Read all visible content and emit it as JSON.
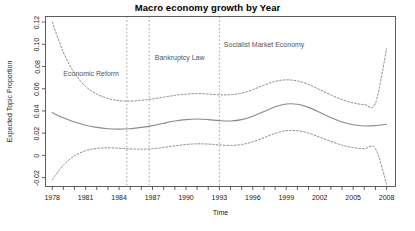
{
  "chart_data": {
    "type": "line",
    "title": "Macro economy growth by Year",
    "xlabel": "Time",
    "ylabel": "Expected Topic Proportion",
    "xlim": [
      1977.4,
      2008.8
    ],
    "ylim": [
      -0.028,
      0.125
    ],
    "grid": false,
    "legend": null,
    "x_ticks": [
      1978,
      1981,
      1984,
      1987,
      1990,
      1993,
      1996,
      1999,
      2002,
      2005,
      2008
    ],
    "x_tick_labels": [
      "1978",
      "1981",
      "1984",
      "1987",
      "1990",
      "1993",
      "1996",
      "1999",
      "2002",
      "2005",
      "2008"
    ],
    "x_minor_ticks": [
      1979,
      1980,
      1982,
      1983,
      1985,
      1986,
      1988,
      1989,
      1991,
      1992,
      1994,
      1995,
      1997,
      1998,
      2000,
      2001,
      2003,
      2004,
      2006,
      2007
    ],
    "y_ticks": [
      -0.02,
      0,
      0.02,
      0.04,
      0.06,
      0.08,
      0.1,
      0.12
    ],
    "y_tick_labels": [
      "-0.02",
      "0",
      "0.02",
      "0.04",
      "0.06",
      "0.08",
      "0.10",
      "0.12"
    ],
    "series": [
      {
        "name": "Expected topic proportion",
        "style": "solid",
        "color": "#8a8a8a",
        "x": [
          1978,
          1979,
          1980,
          1981,
          1982,
          1983,
          1984,
          1985,
          1986,
          1987,
          1988,
          1989,
          1990,
          1991,
          1992,
          1993,
          1994,
          1995,
          1996,
          1997,
          1998,
          1999,
          2000,
          2001,
          2002,
          2003,
          2004,
          2005,
          2006,
          2007,
          2008
        ],
        "values": [
          0.0385,
          0.0338,
          0.03,
          0.0272,
          0.0252,
          0.024,
          0.0236,
          0.024,
          0.0252,
          0.0268,
          0.0289,
          0.0309,
          0.0322,
          0.0327,
          0.0322,
          0.0313,
          0.031,
          0.0322,
          0.0352,
          0.0395,
          0.0437,
          0.0462,
          0.046,
          0.0432,
          0.0388,
          0.034,
          0.03,
          0.0275,
          0.0265,
          0.0268,
          0.028
        ]
      },
      {
        "name": "Upper 95% confidence bound",
        "style": "dashed",
        "color": "#8a8a8a",
        "x": [
          1978,
          1979,
          1980,
          1981,
          1982,
          1983,
          1984,
          1985,
          1986,
          1987,
          1988,
          1989,
          1990,
          1991,
          1992,
          1993,
          1994,
          1995,
          1996,
          1997,
          1998,
          1999,
          2000,
          2001,
          2002,
          2003,
          2004,
          2005,
          2006,
          2007,
          2008
        ],
        "values": [
          0.12,
          0.093,
          0.074,
          0.062,
          0.0552,
          0.0512,
          0.0492,
          0.0489,
          0.0496,
          0.0508,
          0.0524,
          0.054,
          0.0552,
          0.0556,
          0.0552,
          0.0545,
          0.0546,
          0.056,
          0.0592,
          0.0632,
          0.0666,
          0.068,
          0.067,
          0.0638,
          0.0592,
          0.0544,
          0.0502,
          0.0472,
          0.0458,
          0.047,
          0.096
        ]
      },
      {
        "name": "Lower 95% confidence bound",
        "style": "dashed",
        "color": "#8a8a8a",
        "x": [
          1978,
          1979,
          1980,
          1981,
          1982,
          1983,
          1984,
          1985,
          1986,
          1987,
          1988,
          1989,
          1990,
          1991,
          1992,
          1993,
          1994,
          1995,
          1996,
          1997,
          1998,
          1999,
          2000,
          2001,
          2002,
          2003,
          2004,
          2005,
          2006,
          2007,
          2008
        ],
        "values": [
          -0.022,
          -0.0088,
          -0.0005,
          0.0042,
          0.0062,
          0.0068,
          0.0064,
          0.0058,
          0.0056,
          0.006,
          0.0072,
          0.0086,
          0.0098,
          0.0104,
          0.0102,
          0.0094,
          0.009,
          0.0098,
          0.0122,
          0.016,
          0.0198,
          0.0222,
          0.0222,
          0.02,
          0.0164,
          0.0126,
          0.0092,
          0.007,
          0.006,
          0.0062,
          -0.026
        ]
      }
    ],
    "annotations": [
      {
        "label": "Economic Reform",
        "x": 1984.7,
        "label_x": 1979.0,
        "label_y": 0.0715,
        "line_style": "dashed",
        "line_color": "#9a9a9a"
      },
      {
        "label": "Bankruptcy Law",
        "x": 1986.7,
        "label_x": 1987.2,
        "label_y": 0.0855,
        "line_style": "dashed",
        "line_color": "#9a9a9a"
      },
      {
        "label": "Socialist Market Economy",
        "x": 1993.0,
        "label_x": 1993.4,
        "label_y": 0.0975,
        "line_style": "dashed",
        "line_color": "#9a9a9a"
      }
    ]
  }
}
